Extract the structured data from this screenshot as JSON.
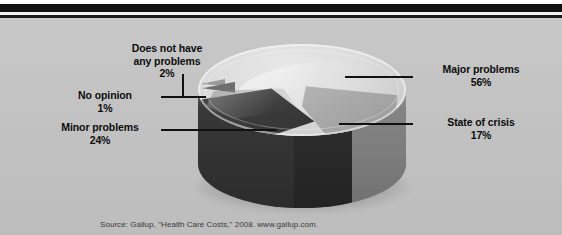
{
  "figure": {
    "source_note": "Source: Gallup, \"Health Care Costs,\" 2008. www.gallup.com."
  },
  "chart_data": {
    "type": "pie",
    "title": "",
    "xlabel": "",
    "ylabel": "",
    "legend_position": "callout-labels",
    "grid": false,
    "units": "percent",
    "categories": [
      "Major problems",
      "Minor problems",
      "State of crisis",
      "Does not have any problems",
      "No opinion"
    ],
    "values": [
      56,
      24,
      17,
      2,
      1
    ],
    "labels": [
      {
        "name": "Major problems",
        "value": 56,
        "value_text": "56%",
        "color": "#d8d8d8"
      },
      {
        "name": "Minor problems",
        "value": 24,
        "value_text": "24%",
        "color": "#3b3b3b"
      },
      {
        "name": "State of crisis",
        "value": 17,
        "value_text": "17%",
        "color": "#a6a6a6"
      },
      {
        "name": "Does not have any problems",
        "value": 2,
        "value_text": "2%",
        "color": "#6e6e6e"
      },
      {
        "name": "No opinion",
        "value": 1,
        "value_text": "1%",
        "color": "#9a9a9a"
      }
    ],
    "annotations": [
      "Does not have any problems",
      "No opinion",
      "Minor problems",
      "Major problems",
      "State of crisis"
    ]
  },
  "callouts": {
    "does_not_have": {
      "line1": "Does not have",
      "line2": "any problems",
      "pct": "2%"
    },
    "no_opinion": {
      "line1": "No opinion",
      "pct": "1%"
    },
    "minor_problems": {
      "line1": "Minor problems",
      "pct": "24%"
    },
    "major_problems": {
      "line1": "Major problems",
      "pct": "56%"
    },
    "state_of_crisis": {
      "line1": "State of crisis",
      "pct": "17%"
    }
  },
  "colors": {
    "background": "#c3c3c3",
    "rule": "#111111",
    "text": "#0d0d0d",
    "source_text": "#3b3b3b"
  }
}
